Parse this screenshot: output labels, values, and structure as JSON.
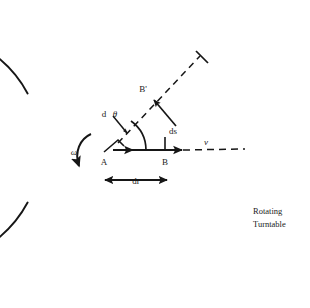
{
  "figure": {
    "title_caption": {
      "line1": "Rotating",
      "line2": "Turntable"
    },
    "colors": {
      "ink": "#161616",
      "background": "#ffffff"
    },
    "labels": {
      "point_a": "A",
      "point_b": "B",
      "point_b_prime": "B'",
      "angle_differential": "d",
      "angle_symbol": "θ",
      "arc_length": "ds",
      "radial_displacement": "dr",
      "velocity": "v",
      "angular_velocity": "ω"
    },
    "geometry": {
      "circle_center_x": 130,
      "circle_center_y": 148,
      "circle_radius": 116,
      "arc_gap_start_deg": 152,
      "arc_gap_end_deg": 208,
      "point_a_x": 110,
      "point_a_y": 150,
      "point_b_x": 165,
      "point_b_y": 150,
      "point_b_prime_x": 152,
      "point_b_prime_y": 95,
      "dashed_ray_angle_deg": -42,
      "dr_span_start_x": 103,
      "dr_span_end_x": 167,
      "dr_span_y": 180
    },
    "elements": {
      "turntable_boundary": "open-circle-arc",
      "radius_line_ab": "solid-arrow-right",
      "radial_dashed_extension": "dashed-line",
      "rotated_radius_dashed": "dashed-line",
      "ds_arrow": "solid-arrow",
      "dr_arrow": "double-headed-arrow",
      "omega_arc_arrow": "curved-arrow-clockwise",
      "angle_arc": "small-arc",
      "angle_pointer": "small-arrow",
      "tick_on_rim": "tick-mark"
    }
  }
}
